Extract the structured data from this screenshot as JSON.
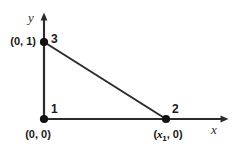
{
  "figure": {
    "background_color": "#ffffff",
    "line_color": "#2b2b2b",
    "node_color": "#111111",
    "text_color": "#1a1a1a",
    "width": 237,
    "height": 147
  },
  "axes": {
    "x": {
      "label": "x",
      "origin_px": [
        44,
        119
      ],
      "tip_px": [
        228,
        119
      ],
      "arrowhead": true
    },
    "y": {
      "label": "y",
      "origin_px": [
        44,
        119
      ],
      "tip_px": [
        44,
        13
      ],
      "arrowhead": true
    }
  },
  "nodes": [
    {
      "number": "1",
      "coordinate_label": "(0, 0)",
      "coordinate_prefix": "(0, 0)",
      "coordinate_var": "",
      "coordinate_sub": "",
      "coordinate_suffix": "",
      "px": [
        44,
        119
      ],
      "number_position": "upper-right",
      "coordinate_position": "below"
    },
    {
      "number": "2",
      "coordinate_label": "(x1, 0)",
      "coordinate_prefix": "(",
      "coordinate_var": "x",
      "coordinate_sub": "1",
      "coordinate_suffix": ", 0)",
      "px": [
        166,
        119
      ],
      "number_position": "upper-right",
      "coordinate_position": "below"
    },
    {
      "number": "3",
      "coordinate_label": "(0, 1)",
      "coordinate_prefix": "(0, 1)",
      "coordinate_var": "",
      "coordinate_sub": "",
      "coordinate_suffix": "",
      "px": [
        44,
        42
      ],
      "number_position": "right",
      "coordinate_position": "left"
    }
  ],
  "edges": [
    {
      "name": "edge-1-3",
      "from": "1",
      "to": "3"
    },
    {
      "name": "edge-1-2",
      "from": "1",
      "to": "2"
    },
    {
      "name": "edge-3-2",
      "from": "3",
      "to": "2"
    }
  ]
}
